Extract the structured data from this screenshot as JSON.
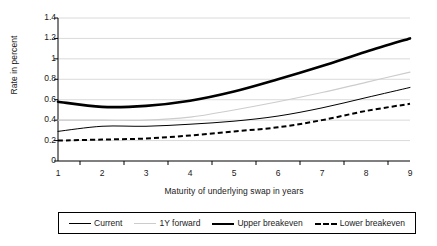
{
  "chart_data": {
    "type": "line",
    "title": "",
    "xlabel": "Maturity of underlying swap in years",
    "ylabel": "Rate in percent",
    "categories": [
      1,
      2,
      3,
      4,
      5,
      6,
      7,
      8,
      9
    ],
    "x_tick_labels": [
      "1",
      "2",
      "3",
      "4",
      "5",
      "6",
      "7",
      "8",
      "9"
    ],
    "y_tick_labels": [
      "0",
      "0.2",
      "0.4",
      "0.6",
      "0.8",
      "1",
      "1.2",
      "1.4"
    ],
    "y_tick_values": [
      0,
      0.2,
      0.4,
      0.6,
      0.8,
      1.0,
      1.2,
      1.4
    ],
    "ylim": [
      0,
      1.4
    ],
    "xlim": [
      1,
      9
    ],
    "grid": "horizontal",
    "legend_position": "bottom",
    "series": [
      {
        "name": "Current",
        "color": "#000000",
        "style": "solid-thin",
        "values": [
          0.29,
          0.34,
          0.34,
          0.36,
          0.39,
          0.44,
          0.52,
          0.62,
          0.72
        ]
      },
      {
        "name": "1Y forward",
        "color": "#cccccc",
        "style": "solid-light",
        "values": [
          0.4,
          0.4,
          0.4,
          0.43,
          0.5,
          0.58,
          0.67,
          0.77,
          0.87
        ]
      },
      {
        "name": "Upper breakeven",
        "color": "#000000",
        "style": "solid-thick",
        "values": [
          0.58,
          0.53,
          0.54,
          0.59,
          0.68,
          0.8,
          0.93,
          1.07,
          1.2
        ]
      },
      {
        "name": "Lower breakeven",
        "color": "#000000",
        "style": "dashed",
        "values": [
          0.2,
          0.21,
          0.22,
          0.25,
          0.29,
          0.33,
          0.4,
          0.49,
          0.56
        ]
      }
    ]
  },
  "legend": {
    "entries": [
      {
        "label": "Current"
      },
      {
        "label": "1Y forward"
      },
      {
        "label": "Upper breakeven"
      },
      {
        "label": "Lower breakeven"
      }
    ]
  },
  "axes": {
    "axis_color": "#000000",
    "grid_color": "#d0d0d0"
  }
}
